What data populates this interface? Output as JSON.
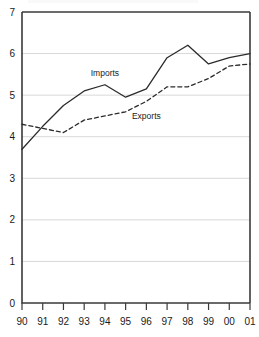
{
  "chart_data": {
    "type": "line",
    "title": "",
    "subtitle": "",
    "xlabel": "",
    "ylabel": "",
    "x": [
      "90",
      "91",
      "92",
      "93",
      "94",
      "95",
      "96",
      "97",
      "98",
      "99",
      "00",
      "01"
    ],
    "xtick_labels": [
      "90",
      "91",
      "92",
      "93",
      "94",
      "95",
      "96",
      "97",
      "98",
      "99",
      "00",
      "01"
    ],
    "ytick_labels": [
      "0",
      "1",
      "2",
      "3",
      "4",
      "5",
      "6",
      "7"
    ],
    "yticks": [
      0,
      1,
      2,
      3,
      4,
      5,
      6,
      7
    ],
    "ylim": [
      0,
      7
    ],
    "grid": "horizontal",
    "legend": "inline-annotations",
    "series": [
      {
        "name": "Imports",
        "style": "solid",
        "color": "#2b2b2b",
        "values": [
          3.7,
          4.25,
          4.75,
          5.1,
          5.25,
          4.95,
          5.15,
          5.9,
          6.2,
          5.75,
          5.9,
          6.0
        ]
      },
      {
        "name": "Exports",
        "style": "dashed",
        "color": "#2b2b2b",
        "values": [
          4.3,
          4.2,
          4.1,
          4.4,
          4.5,
          4.6,
          4.85,
          5.2,
          5.2,
          5.4,
          5.7,
          5.75
        ]
      }
    ],
    "annotations": [
      {
        "text": "Imports",
        "x_value": "94",
        "y_value": 5.45
      },
      {
        "text": "Exports",
        "x_value": "96",
        "y_value": 4.42
      }
    ],
    "colors": {
      "gridline": "#d8d8d8",
      "axis": "#3a3a3a",
      "text": "#1a1a1a",
      "background": "#ffffff"
    }
  }
}
